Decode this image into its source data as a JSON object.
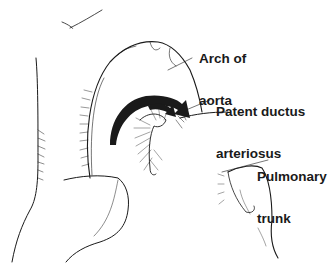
{
  "diagram": {
    "labels": [
      {
        "id": "arch",
        "line1": "Arch of",
        "line2": "aorta"
      },
      {
        "id": "ductus",
        "line1": "Patent ductus",
        "line2": "arteriosus"
      },
      {
        "id": "pulmonary",
        "line1": "Pulmonary",
        "line2": "trunk"
      }
    ],
    "colors": {
      "ink": "#1a1a1a",
      "background": "#ffffff"
    },
    "arrows": [
      {
        "name": "large-flow-arrow",
        "direction": "clockwise toward ductus"
      },
      {
        "name": "small-flow-arrow",
        "direction": "clockwise toward ductus"
      }
    ]
  }
}
